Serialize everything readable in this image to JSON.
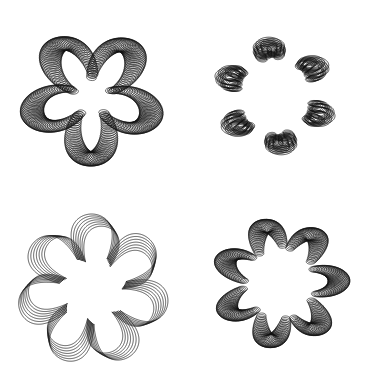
{
  "canvas": {
    "width": 367,
    "height": 389,
    "background": "#ffffff",
    "stroke": "#111111"
  },
  "patterns": [
    {
      "name": "pinwheel-five-arm",
      "position": "top-left",
      "center": [
        92,
        97
      ],
      "radius": 74,
      "symmetry": 5,
      "style": "dense-loops",
      "copies": 60,
      "loop_radius": 12,
      "inner_radius": 16,
      "twist": 1.35,
      "stroke_width": 0.6,
      "rotation": -0.35
    },
    {
      "name": "ring-six-loops",
      "position": "top-right",
      "center": [
        275,
        96
      ],
      "radius": 64,
      "symmetry": 6,
      "style": "sparse-loops",
      "copies": 6,
      "loop_radius": 12,
      "inner_radius": 42,
      "twist": 0.5,
      "stroke_width": 0.7,
      "rotation": 0.15
    },
    {
      "name": "star-seven-ribbon",
      "position": "bottom-left",
      "center": [
        93,
        290
      ],
      "radius": 76,
      "symmetry": 7,
      "style": "ribbon",
      "copies": 7,
      "loop_radius": 0,
      "inner_radius": 34,
      "twist": 0.9,
      "stroke_width": 0.7,
      "rotation": 0.2
    },
    {
      "name": "ring-seven-feathers",
      "position": "bottom-right",
      "center": [
        280,
        283
      ],
      "radius": 70,
      "symmetry": 7,
      "style": "dense-loops",
      "copies": 40,
      "loop_radius": 11,
      "inner_radius": 34,
      "twist": 0.7,
      "stroke_width": 0.6,
      "rotation": 0.5
    }
  ]
}
